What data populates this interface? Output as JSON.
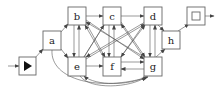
{
  "diagram": {
    "type": "state-graph",
    "start": {
      "id": "start",
      "glyph": "play-triangle",
      "x": 19,
      "y": 57,
      "w": 17,
      "h": 18
    },
    "end": {
      "id": "end",
      "glyph": "filled-square",
      "x": 187,
      "y": 7,
      "w": 18,
      "h": 18
    },
    "nodes": [
      {
        "id": "a",
        "label": "a",
        "x": 43,
        "y": 31,
        "w": 18,
        "h": 19
      },
      {
        "id": "b",
        "label": "b",
        "x": 68,
        "y": 7,
        "w": 18,
        "h": 18
      },
      {
        "id": "c",
        "label": "c",
        "x": 103,
        "y": 7,
        "w": 18,
        "h": 18
      },
      {
        "id": "d",
        "label": "d",
        "x": 144,
        "y": 7,
        "w": 18,
        "h": 18
      },
      {
        "id": "h",
        "label": "h",
        "x": 162,
        "y": 31,
        "w": 18,
        "h": 18
      },
      {
        "id": "e",
        "label": "e",
        "x": 68,
        "y": 57,
        "w": 18,
        "h": 19
      },
      {
        "id": "f",
        "label": "f",
        "x": 103,
        "y": 57,
        "w": 18,
        "h": 19
      },
      {
        "id": "g",
        "label": "g",
        "x": 144,
        "y": 57,
        "w": 18,
        "h": 19
      }
    ],
    "edges": [
      {
        "from": "input",
        "to": "start"
      },
      {
        "from": "start",
        "to": "a"
      },
      {
        "from": "a",
        "to": "b"
      },
      {
        "from": "a",
        "to": "e"
      },
      {
        "from": "a",
        "to": "g",
        "curved": true
      },
      {
        "from": "b",
        "to": "c"
      },
      {
        "from": "b",
        "to": "e"
      },
      {
        "from": "e",
        "to": "b"
      },
      {
        "from": "c",
        "to": "d"
      },
      {
        "from": "c",
        "to": "f"
      },
      {
        "from": "f",
        "to": "c"
      },
      {
        "from": "d",
        "to": "h"
      },
      {
        "from": "d",
        "to": "g"
      },
      {
        "from": "g",
        "to": "d"
      },
      {
        "from": "e",
        "to": "f"
      },
      {
        "from": "f",
        "to": "g"
      },
      {
        "from": "g",
        "to": "f"
      },
      {
        "from": "g",
        "to": "h"
      },
      {
        "from": "h",
        "to": "end"
      },
      {
        "from": "end",
        "to": "output"
      },
      {
        "from": "e",
        "to": "c"
      },
      {
        "from": "e",
        "to": "d"
      },
      {
        "from": "c",
        "to": "e"
      },
      {
        "from": "d",
        "to": "e"
      },
      {
        "from": "b",
        "to": "f"
      },
      {
        "from": "f",
        "to": "b"
      },
      {
        "from": "b",
        "to": "g"
      },
      {
        "from": "g",
        "to": "b"
      },
      {
        "from": "c",
        "to": "g"
      },
      {
        "from": "g",
        "to": "c"
      },
      {
        "from": "d",
        "to": "f"
      },
      {
        "from": "f",
        "to": "d"
      },
      {
        "from": "g",
        "to": "e",
        "curved": true
      },
      {
        "from": "e",
        "to": "g",
        "curved": true
      }
    ]
  }
}
